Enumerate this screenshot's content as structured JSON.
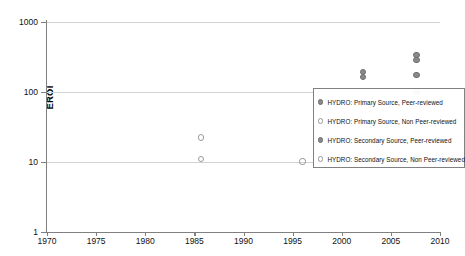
{
  "chart_data": {
    "type": "scatter",
    "title": "",
    "xlabel": "",
    "ylabel": "EROI",
    "xlim": [
      1970,
      2010
    ],
    "ylim": [
      1,
      1000
    ],
    "yscale": "log",
    "grid": true,
    "legend_position": "right-middle",
    "xticks": [
      "1970",
      "1975",
      "1980",
      "1985",
      "1990",
      "1995",
      "2000",
      "2005",
      "2010"
    ],
    "yticks": [
      "1",
      "10",
      "100",
      "1000"
    ],
    "series": [
      {
        "name": "HYDRO: Primary Source, Peer-reviewed",
        "marker": "filled-circle",
        "color": "#8a8a8a",
        "points": [
          {
            "x": 2007.6,
            "y": 100
          },
          {
            "x": 2007.6,
            "y": 11.5
          },
          {
            "x": 2007.3,
            "y": 10.5
          }
        ]
      },
      {
        "name": "HYDRO: Primary Source, Non Peer-reviewed",
        "marker": "hollow-circle",
        "color": "#9a9a9a",
        "points": [
          {
            "x": 1985.7,
            "y": 22
          },
          {
            "x": 1985.7,
            "y": 11
          },
          {
            "x": 1996.0,
            "y": 10
          },
          {
            "x": 2002.3,
            "y": 22
          },
          {
            "x": 2006.9,
            "y": 31
          },
          {
            "x": 2007.8,
            "y": 34
          },
          {
            "x": 2007.8,
            "y": 22
          }
        ]
      },
      {
        "name": "HYDRO: Secondary Source, Peer-reviewed",
        "marker": "filled-circle",
        "color": "#8a8a8a",
        "points": [
          {
            "x": 2002.2,
            "y": 190
          },
          {
            "x": 2002.2,
            "y": 160
          },
          {
            "x": 2007.6,
            "y": 330
          },
          {
            "x": 2007.6,
            "y": 280
          },
          {
            "x": 2007.6,
            "y": 170
          }
        ]
      },
      {
        "name": "HYDRO: Secondary Source, Non Peer-reviewed",
        "marker": "hollow-circle",
        "color": "#9a9a9a",
        "points": []
      }
    ]
  },
  "legend": {
    "entries": [
      {
        "label": "HYDRO: Primary Source, Peer-reviewed",
        "marker": "filled"
      },
      {
        "label": "HYDRO: Primary Source, Non Peer-reviewed",
        "marker": "hollow"
      },
      {
        "label": "HYDRO: Secondary Source, Peer-reviewed",
        "marker": "filled"
      },
      {
        "label": "HYDRO: Secondary Source, Non Peer-reviewed",
        "marker": "hollow"
      }
    ]
  }
}
